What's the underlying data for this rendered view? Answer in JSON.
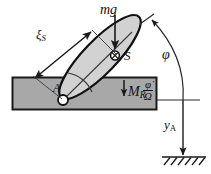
{
  "figure": {
    "type": "mechanics-free-body-diagram",
    "colors": {
      "block_fill": "#a8a8a8",
      "block_stroke": "#1a1a1a",
      "rod_fill": "#d2d2d2",
      "rod_stroke": "#111111",
      "line": "#2a2a2a",
      "ground": "#1a1a1a",
      "background": "#ffffff"
    }
  },
  "labels": {
    "weight": {
      "text": "mg",
      "desc": "gravity force on center of mass"
    },
    "xi_s": {
      "symbol": "ξ",
      "subscript": "S",
      "desc": "distance from pivot A to center of mass S"
    },
    "center_of_mass": {
      "text": "S",
      "desc": "center of mass marker"
    },
    "pivot": {
      "text": "A",
      "desc": "pivot point on the block surface"
    },
    "friction_moment": {
      "symbol": "M",
      "subscript": "R",
      "desc": "friction moment at pivot"
    },
    "ratio": {
      "numerator": "φ̇",
      "denominator": "Ω",
      "desc": "phi-dot over Omega, sign factor of friction moment"
    },
    "angle": {
      "text": "φ",
      "desc": "rod inclination angle"
    },
    "height": {
      "symbol": "y",
      "subscript": "A",
      "desc": "height of pivot A above ground"
    }
  },
  "geometry": {
    "block": {
      "x": 12,
      "y": 77,
      "width": 145,
      "height": 33
    },
    "rod_center": {
      "x": 100,
      "y": 57
    },
    "rod_length": 112,
    "rod_width": 33,
    "rod_angle_deg": -46,
    "pivot_point": {
      "x": 63,
      "y": 100
    },
    "com_point": {
      "x": 115,
      "y": 55
    },
    "ground_line": {
      "x1": 162,
      "y1": 157,
      "x2": 205,
      "y2": 157
    },
    "vertical_ref": {
      "x": 183,
      "y_top": 100,
      "y_bottom": 157
    }
  },
  "annotations": {
    "hatch_count": 6,
    "arc_label_position": "right",
    "arrow_tip": "rod distal end"
  }
}
